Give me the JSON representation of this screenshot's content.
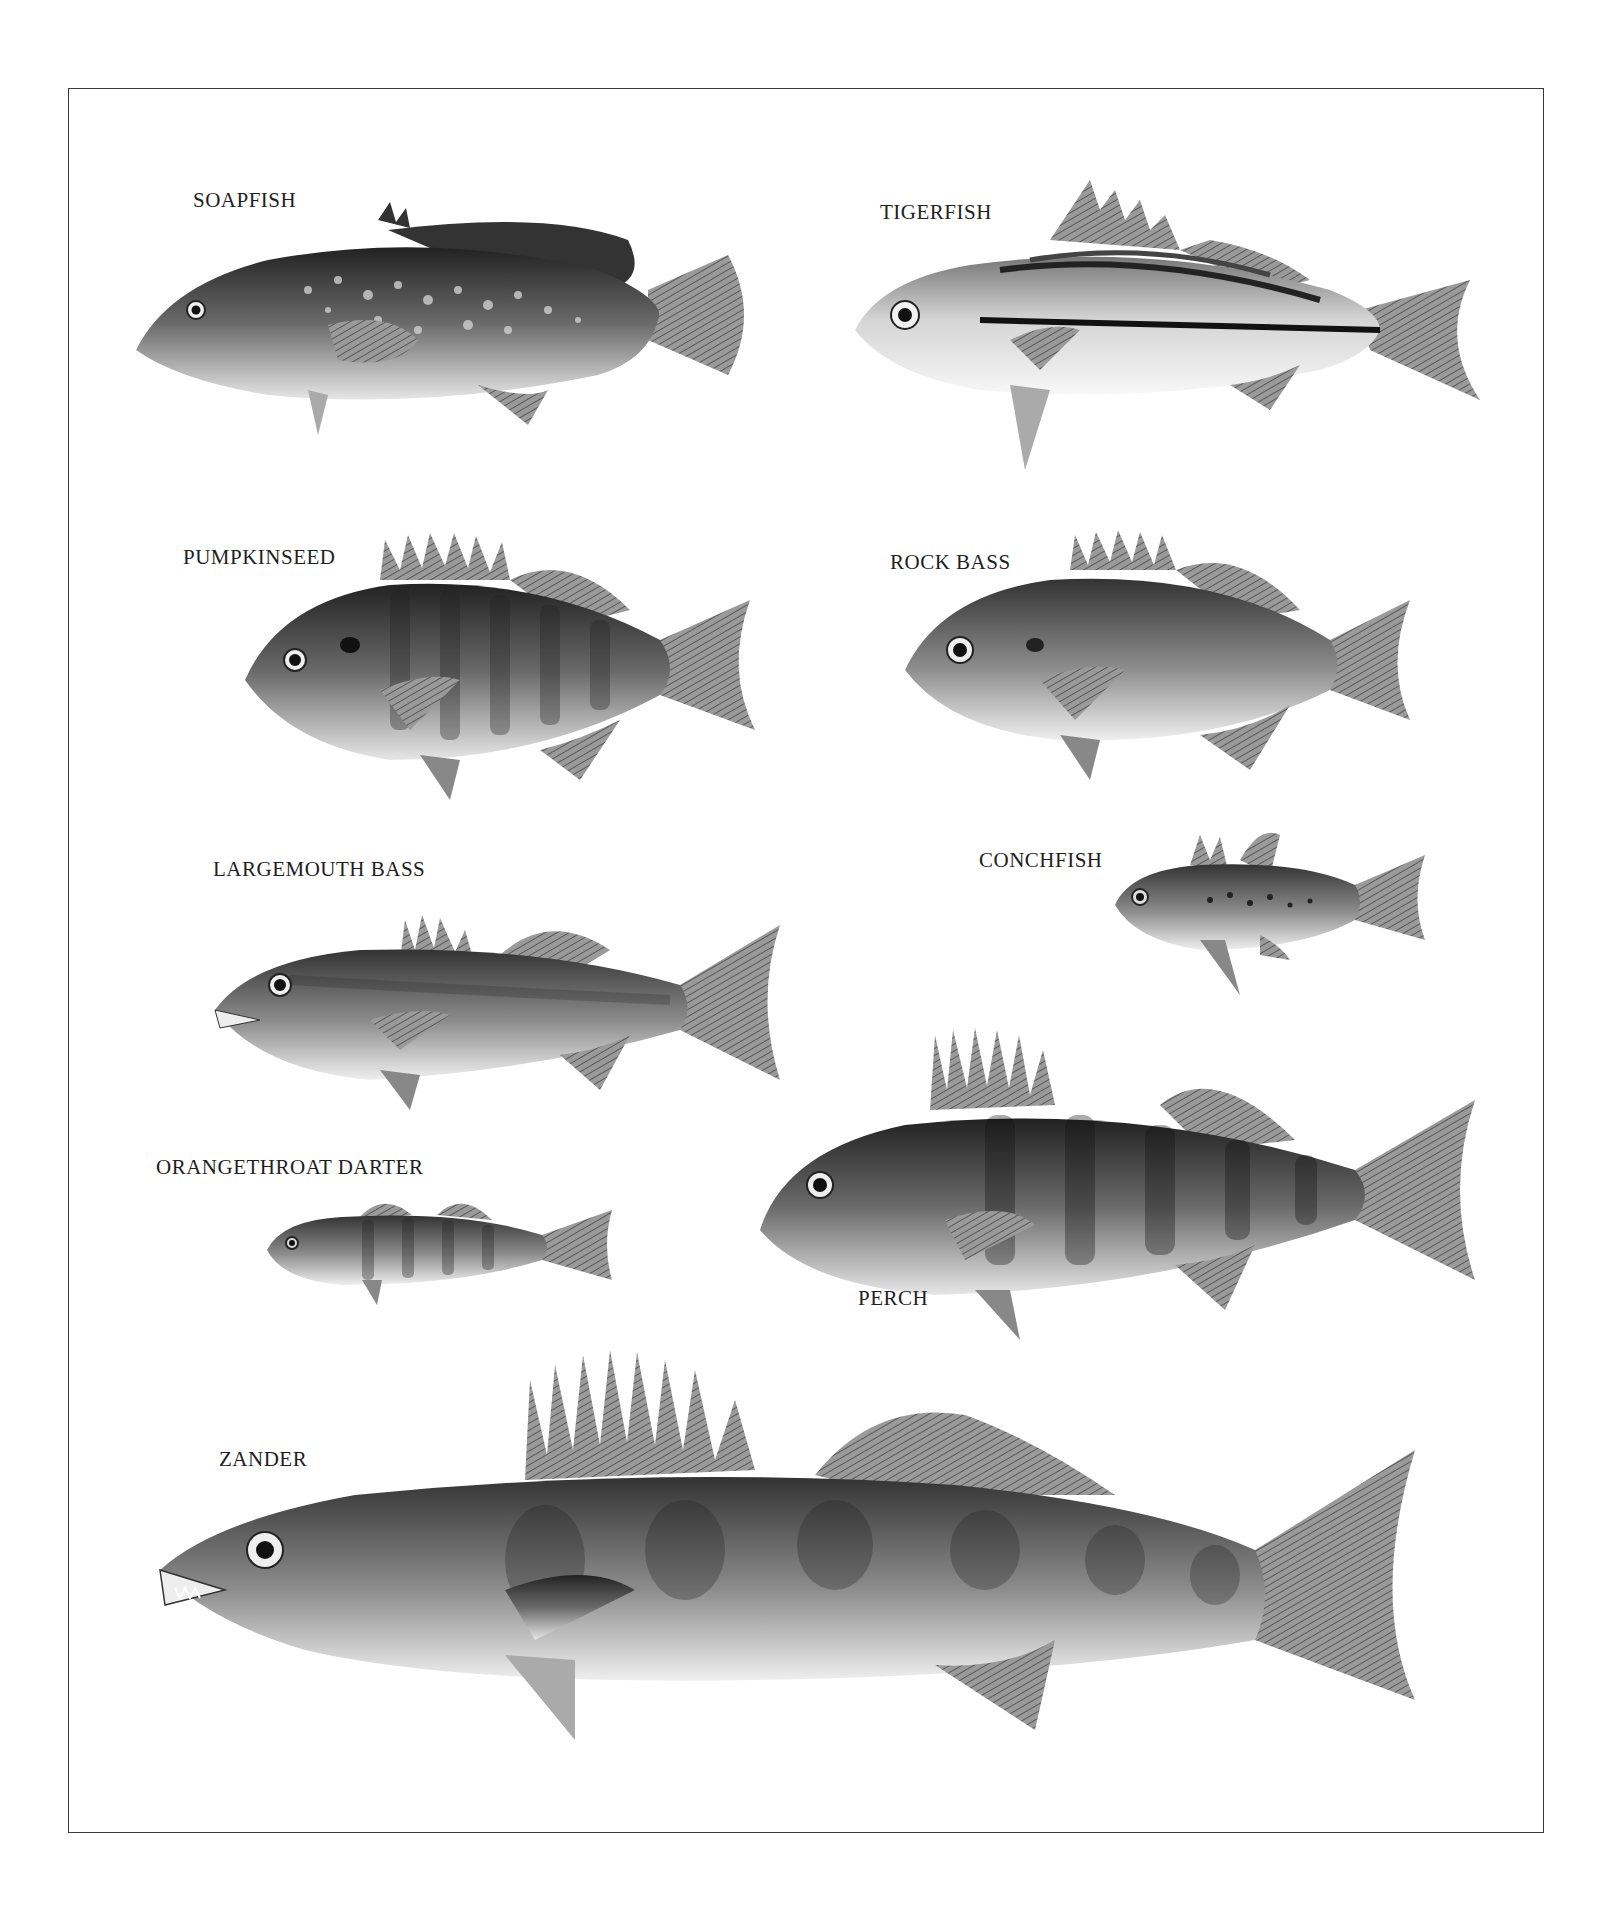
{
  "plate": {
    "title": "",
    "border_color": "#3a3a3a",
    "background": "#ffffff"
  },
  "fish": [
    {
      "id": "soapfish",
      "label": "SOAPFISH"
    },
    {
      "id": "tigerfish",
      "label": "TIGERFISH"
    },
    {
      "id": "pumpkinseed",
      "label": "PUMPKINSEED"
    },
    {
      "id": "rock-bass",
      "label": "ROCK BASS"
    },
    {
      "id": "largemouth-bass",
      "label": "LARGEMOUTH BASS"
    },
    {
      "id": "conchfish",
      "label": "CONCHFISH"
    },
    {
      "id": "orangethroat-darter",
      "label": "ORANGETHROAT DARTER"
    },
    {
      "id": "perch",
      "label": "PERCH"
    },
    {
      "id": "zander",
      "label": "ZANDER"
    }
  ]
}
